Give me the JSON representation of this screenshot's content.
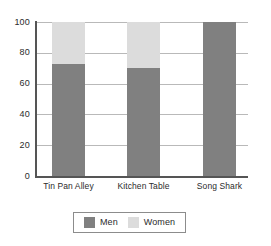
{
  "chart_data": {
    "type": "bar",
    "subtype": "stacked-100-percent",
    "title": "",
    "subtitle": "",
    "xlabel": "",
    "ylabel": "",
    "categories": [
      "Tin Pan Alley",
      "Kitchen Table",
      "Song Shark"
    ],
    "series": [
      {
        "name": "Men",
        "values": [
          73,
          70,
          100
        ],
        "color": "#808080"
      },
      {
        "name": "Women",
        "values": [
          27,
          30,
          0
        ],
        "color": "#dcdcdc"
      }
    ],
    "ylim": [
      0,
      100
    ],
    "yticks": [
      0,
      20,
      40,
      60,
      80,
      100
    ],
    "ytick_labels": [
      "0",
      "20",
      "40",
      "60",
      "80",
      "100"
    ],
    "grid": true,
    "grid_axis": "y",
    "grid_color": "#b9b9b9",
    "axis_color": "#555555",
    "background": "#ffffff",
    "legend": {
      "position": "bottom",
      "boxed": true,
      "entries": [
        {
          "label": "Men",
          "color": "#808080"
        },
        {
          "label": "Women",
          "color": "#dcdcdc"
        }
      ]
    }
  }
}
